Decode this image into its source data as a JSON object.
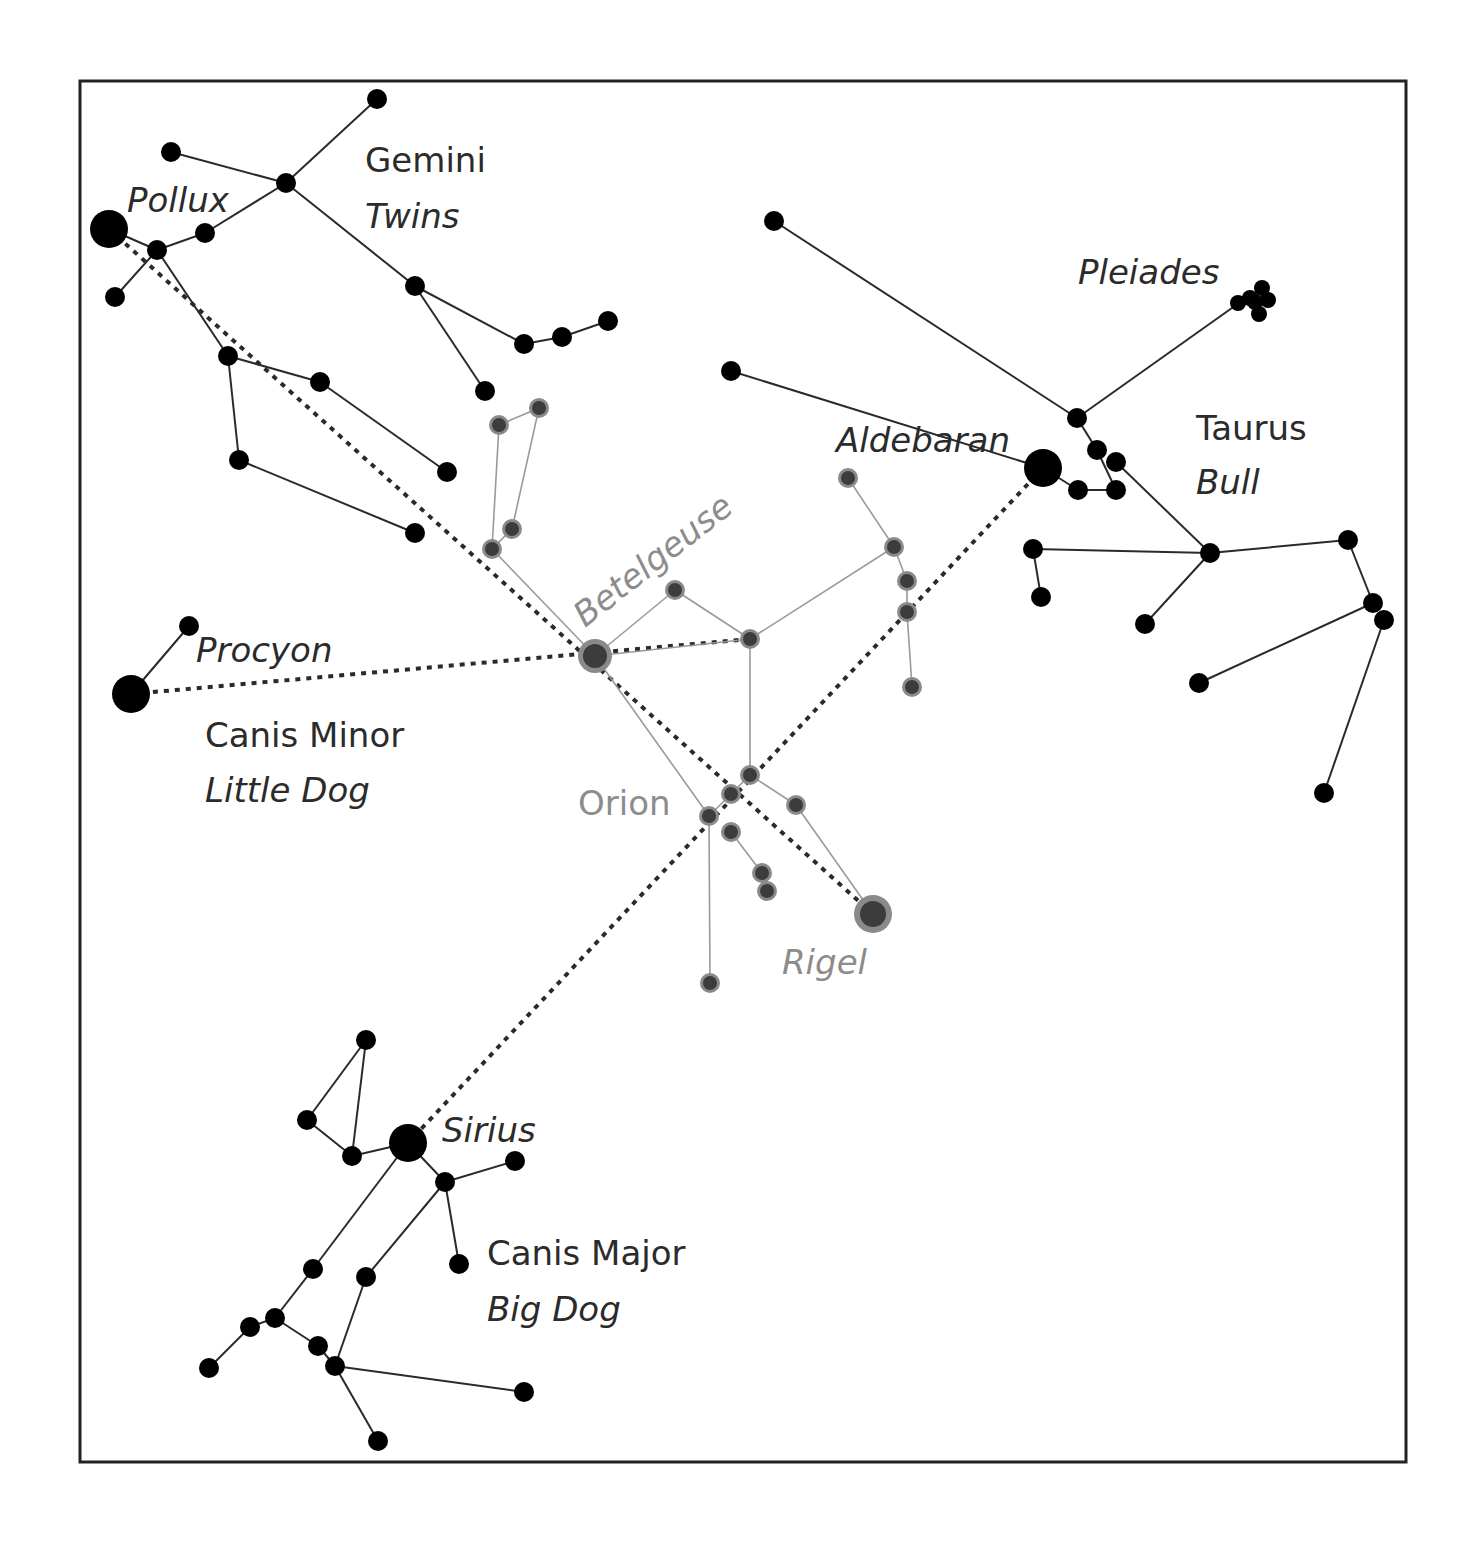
{
  "diagram": {
    "frame": {
      "x": 80,
      "y": 81,
      "width": 1326,
      "height": 1381
    },
    "colors": {
      "background": "#ffffff",
      "frame": "#222222",
      "star": "#000000",
      "line": "#2a2a2a",
      "orion_star_core": "#3c3c3c",
      "orion_star_halo": "#8a8a8a",
      "orion_line": "#9a9a9a",
      "label_dark": "#2b2b2b",
      "label_gray": "#8c8c8c"
    }
  },
  "labels": {
    "gemini": {
      "text": "Gemini",
      "x": 365,
      "y": 172,
      "italic": false,
      "gray": false
    },
    "twins": {
      "text": "Twins",
      "x": 365,
      "y": 228,
      "italic": true,
      "gray": false
    },
    "pollux": {
      "text": "Pollux",
      "x": 127,
      "y": 212,
      "italic": true,
      "gray": false
    },
    "pleiades": {
      "text": "Pleiades",
      "x": 1078,
      "y": 284,
      "italic": true,
      "gray": false
    },
    "aldebaran": {
      "text": "Aldebaran",
      "x": 836,
      "y": 452,
      "italic": true,
      "gray": false
    },
    "taurus": {
      "text": "Taurus",
      "x": 1196,
      "y": 440,
      "italic": false,
      "gray": false
    },
    "bull": {
      "text": "Bull",
      "x": 1196,
      "y": 494,
      "italic": true,
      "gray": false
    },
    "betelgeuse": {
      "text": "Betelgeuse",
      "x": 585,
      "y": 628,
      "italic": true,
      "gray": true,
      "rotate": -38
    },
    "procyon": {
      "text": "Procyon",
      "x": 196,
      "y": 662,
      "italic": true,
      "gray": false
    },
    "canis_minor": {
      "text": "Canis Minor",
      "x": 205,
      "y": 747,
      "italic": false,
      "gray": false
    },
    "little_dog": {
      "text": "Little Dog",
      "x": 205,
      "y": 802,
      "italic": true,
      "gray": false
    },
    "orion": {
      "text": "Orion",
      "x": 578,
      "y": 815,
      "italic": false,
      "gray": true
    },
    "rigel": {
      "text": "Rigel",
      "x": 782,
      "y": 974,
      "italic": true,
      "gray": true
    },
    "sirius": {
      "text": "Sirius",
      "x": 442,
      "y": 1142,
      "italic": true,
      "gray": false
    },
    "canis_major": {
      "text": "Canis Major",
      "x": 487,
      "y": 1265,
      "italic": false,
      "gray": false
    },
    "big_dog": {
      "text": "Big Dog",
      "x": 487,
      "y": 1321,
      "italic": true,
      "gray": false
    }
  },
  "constellations": [
    {
      "name": "Gemini",
      "style": "black",
      "stars": [
        {
          "id": "pollux",
          "x": 109,
          "y": 229,
          "r": 19
        },
        {
          "id": "g1",
          "x": 377,
          "y": 99,
          "r": 10
        },
        {
          "id": "g2",
          "x": 171,
          "y": 152,
          "r": 10
        },
        {
          "id": "g3",
          "x": 286,
          "y": 183,
          "r": 10
        },
        {
          "id": "g4",
          "x": 205,
          "y": 233,
          "r": 10
        },
        {
          "id": "g5",
          "x": 157,
          "y": 250,
          "r": 10
        },
        {
          "id": "g6",
          "x": 115,
          "y": 297,
          "r": 10
        },
        {
          "id": "g7",
          "x": 415,
          "y": 286,
          "r": 10
        },
        {
          "id": "g8",
          "x": 524,
          "y": 344,
          "r": 10
        },
        {
          "id": "g9",
          "x": 562,
          "y": 337,
          "r": 10
        },
        {
          "id": "g10",
          "x": 608,
          "y": 321,
          "r": 10
        },
        {
          "id": "g11",
          "x": 485,
          "y": 391,
          "r": 10
        },
        {
          "id": "g12",
          "x": 228,
          "y": 356,
          "r": 10
        },
        {
          "id": "g13",
          "x": 320,
          "y": 382,
          "r": 10
        },
        {
          "id": "g14",
          "x": 447,
          "y": 472,
          "r": 10
        },
        {
          "id": "g15",
          "x": 239,
          "y": 460,
          "r": 10
        },
        {
          "id": "g16",
          "x": 415,
          "y": 533,
          "r": 10
        }
      ],
      "lines": [
        [
          377,
          99,
          286,
          183
        ],
        [
          171,
          152,
          286,
          183
        ],
        [
          286,
          183,
          205,
          233
        ],
        [
          205,
          233,
          157,
          250
        ],
        [
          109,
          229,
          157,
          250
        ],
        [
          157,
          250,
          115,
          297
        ],
        [
          286,
          183,
          415,
          286
        ],
        [
          415,
          286,
          524,
          344
        ],
        [
          524,
          344,
          562,
          337
        ],
        [
          562,
          337,
          608,
          321
        ],
        [
          415,
          286,
          485,
          391
        ],
        [
          157,
          250,
          228,
          356
        ],
        [
          228,
          356,
          320,
          382
        ],
        [
          320,
          382,
          447,
          472
        ],
        [
          228,
          356,
          239,
          460
        ],
        [
          239,
          460,
          415,
          533
        ]
      ]
    },
    {
      "name": "Taurus",
      "style": "black",
      "stars": [
        {
          "id": "aldebaran",
          "x": 1043,
          "y": 468,
          "r": 19
        },
        {
          "id": "t1",
          "x": 774,
          "y": 221,
          "r": 10
        },
        {
          "id": "t2",
          "x": 731,
          "y": 371,
          "r": 10
        },
        {
          "id": "t3",
          "x": 1077,
          "y": 418,
          "r": 10
        },
        {
          "id": "t4",
          "x": 1097,
          "y": 450,
          "r": 10
        },
        {
          "id": "t5",
          "x": 1116,
          "y": 462,
          "r": 10
        },
        {
          "id": "t6",
          "x": 1078,
          "y": 490,
          "r": 10
        },
        {
          "id": "t7",
          "x": 1116,
          "y": 490,
          "r": 10
        },
        {
          "id": "t8",
          "x": 1210,
          "y": 553,
          "r": 10
        },
        {
          "id": "t9",
          "x": 1033,
          "y": 549,
          "r": 10
        },
        {
          "id": "t10",
          "x": 1041,
          "y": 597,
          "r": 10
        },
        {
          "id": "t11",
          "x": 1145,
          "y": 624,
          "r": 10
        },
        {
          "id": "t12",
          "x": 1348,
          "y": 540,
          "r": 10
        },
        {
          "id": "t13",
          "x": 1373,
          "y": 603,
          "r": 10
        },
        {
          "id": "t14",
          "x": 1384,
          "y": 620,
          "r": 10
        },
        {
          "id": "t15",
          "x": 1199,
          "y": 683,
          "r": 10
        },
        {
          "id": "t16",
          "x": 1324,
          "y": 793,
          "r": 10
        }
      ],
      "lines": [
        [
          774,
          221,
          1077,
          418
        ],
        [
          1077,
          418,
          1239,
          303
        ],
        [
          731,
          371,
          1043,
          468
        ],
        [
          1077,
          418,
          1097,
          450
        ],
        [
          1097,
          450,
          1116,
          490
        ],
        [
          1043,
          468,
          1078,
          490
        ],
        [
          1078,
          490,
          1116,
          490
        ],
        [
          1116,
          462,
          1210,
          553
        ],
        [
          1033,
          549,
          1210,
          553
        ],
        [
          1033,
          549,
          1041,
          597
        ],
        [
          1210,
          553,
          1145,
          624
        ],
        [
          1210,
          553,
          1348,
          540
        ],
        [
          1348,
          540,
          1373,
          603
        ],
        [
          1373,
          603,
          1199,
          683
        ],
        [
          1384,
          620,
          1324,
          793
        ]
      ]
    },
    {
      "name": "Pleiades",
      "style": "black",
      "stars": [
        {
          "id": "p1",
          "x": 1238,
          "y": 303,
          "r": 8
        },
        {
          "id": "p2",
          "x": 1250,
          "y": 298,
          "r": 8
        },
        {
          "id": "p3",
          "x": 1262,
          "y": 288,
          "r": 8
        },
        {
          "id": "p4",
          "x": 1268,
          "y": 300,
          "r": 8
        },
        {
          "id": "p5",
          "x": 1259,
          "y": 314,
          "r": 8
        },
        {
          "id": "p6",
          "x": 1255,
          "y": 302,
          "r": 8
        }
      ],
      "lines": []
    },
    {
      "name": "Orion",
      "style": "gray",
      "stars": [
        {
          "id": "betelgeuse",
          "x": 595,
          "y": 656,
          "r": 17
        },
        {
          "id": "rigel",
          "x": 873,
          "y": 914,
          "r": 19
        },
        {
          "id": "o1",
          "x": 499,
          "y": 425,
          "r": 10
        },
        {
          "id": "o2",
          "x": 539,
          "y": 408,
          "r": 10
        },
        {
          "id": "o3",
          "x": 512,
          "y": 529,
          "r": 10
        },
        {
          "id": "o4",
          "x": 492,
          "y": 549,
          "r": 10
        },
        {
          "id": "o5",
          "x": 675,
          "y": 590,
          "r": 10
        },
        {
          "id": "o6",
          "x": 750,
          "y": 639,
          "r": 10
        },
        {
          "id": "o7",
          "x": 848,
          "y": 478,
          "r": 10
        },
        {
          "id": "o8",
          "x": 894,
          "y": 547,
          "r": 10
        },
        {
          "id": "o9",
          "x": 907,
          "y": 581,
          "r": 10
        },
        {
          "id": "o10",
          "x": 907,
          "y": 612,
          "r": 10
        },
        {
          "id": "o11",
          "x": 912,
          "y": 687,
          "r": 10
        },
        {
          "id": "o12",
          "x": 750,
          "y": 775,
          "r": 10
        },
        {
          "id": "o13",
          "x": 731,
          "y": 794,
          "r": 10
        },
        {
          "id": "o14",
          "x": 709,
          "y": 816,
          "r": 10
        },
        {
          "id": "o15",
          "x": 796,
          "y": 805,
          "r": 10
        },
        {
          "id": "o16",
          "x": 731,
          "y": 832,
          "r": 10
        },
        {
          "id": "o17",
          "x": 762,
          "y": 873,
          "r": 10
        },
        {
          "id": "o18",
          "x": 767,
          "y": 891,
          "r": 10
        },
        {
          "id": "o19",
          "x": 710,
          "y": 983,
          "r": 10
        }
      ],
      "lines": [
        [
          499,
          425,
          539,
          408
        ],
        [
          499,
          425,
          492,
          549
        ],
        [
          539,
          408,
          512,
          529
        ],
        [
          512,
          529,
          492,
          549
        ],
        [
          492,
          549,
          595,
          656
        ],
        [
          595,
          656,
          675,
          590
        ],
        [
          675,
          590,
          750,
          639
        ],
        [
          595,
          656,
          750,
          639
        ],
        [
          750,
          639,
          894,
          547
        ],
        [
          848,
          478,
          894,
          547
        ],
        [
          894,
          547,
          907,
          581
        ],
        [
          907,
          581,
          907,
          612
        ],
        [
          907,
          612,
          912,
          687
        ],
        [
          750,
          639,
          750,
          775
        ],
        [
          595,
          656,
          709,
          816
        ],
        [
          709,
          816,
          731,
          794
        ],
        [
          731,
          794,
          750,
          775
        ],
        [
          750,
          775,
          796,
          805
        ],
        [
          796,
          805,
          873,
          914
        ],
        [
          709,
          816,
          710,
          983
        ],
        [
          731,
          832,
          762,
          873
        ]
      ]
    },
    {
      "name": "Canis Minor",
      "style": "black",
      "stars": [
        {
          "id": "procyon",
          "x": 131,
          "y": 694,
          "r": 19
        },
        {
          "id": "cm1",
          "x": 189,
          "y": 626,
          "r": 10
        }
      ],
      "lines": [
        [
          131,
          694,
          189,
          626
        ]
      ]
    },
    {
      "name": "Canis Major",
      "style": "black",
      "stars": [
        {
          "id": "sirius",
          "x": 408,
          "y": 1143,
          "r": 19
        },
        {
          "id": "cma1",
          "x": 366,
          "y": 1040,
          "r": 10
        },
        {
          "id": "cma2",
          "x": 307,
          "y": 1120,
          "r": 10
        },
        {
          "id": "cma3",
          "x": 352,
          "y": 1156,
          "r": 10
        },
        {
          "id": "cma4",
          "x": 515,
          "y": 1161,
          "r": 10
        },
        {
          "id": "cma5",
          "x": 445,
          "y": 1182,
          "r": 10
        },
        {
          "id": "cma6",
          "x": 459,
          "y": 1264,
          "r": 10
        },
        {
          "id": "cma7",
          "x": 313,
          "y": 1269,
          "r": 10
        },
        {
          "id": "cma8",
          "x": 366,
          "y": 1277,
          "r": 10
        },
        {
          "id": "cma9",
          "x": 275,
          "y": 1318,
          "r": 10
        },
        {
          "id": "cma10",
          "x": 250,
          "y": 1327,
          "r": 10
        },
        {
          "id": "cma11",
          "x": 318,
          "y": 1346,
          "r": 10
        },
        {
          "id": "cma12",
          "x": 335,
          "y": 1366,
          "r": 10
        },
        {
          "id": "cma13",
          "x": 209,
          "y": 1368,
          "r": 10
        },
        {
          "id": "cma14",
          "x": 524,
          "y": 1392,
          "r": 10
        },
        {
          "id": "cma15",
          "x": 378,
          "y": 1441,
          "r": 10
        }
      ],
      "lines": [
        [
          366,
          1040,
          307,
          1120
        ],
        [
          366,
          1040,
          352,
          1156
        ],
        [
          307,
          1120,
          352,
          1156
        ],
        [
          352,
          1156,
          408,
          1143
        ],
        [
          408,
          1143,
          445,
          1182
        ],
        [
          445,
          1182,
          515,
          1161
        ],
        [
          445,
          1182,
          459,
          1264
        ],
        [
          408,
          1143,
          313,
          1269
        ],
        [
          313,
          1269,
          275,
          1318
        ],
        [
          275,
          1318,
          250,
          1327
        ],
        [
          250,
          1327,
          209,
          1368
        ],
        [
          275,
          1318,
          318,
          1346
        ],
        [
          318,
          1346,
          335,
          1366
        ],
        [
          445,
          1182,
          366,
          1277
        ],
        [
          366,
          1277,
          335,
          1366
        ],
        [
          335,
          1366,
          524,
          1392
        ],
        [
          335,
          1366,
          378,
          1441
        ]
      ]
    }
  ],
  "pointer_lines": [
    {
      "name": "pollux-to-rigel",
      "x1": 109,
      "y1": 229,
      "x2": 873,
      "y2": 914
    },
    {
      "name": "procyon-to-betelgeuse-belt",
      "x1": 131,
      "y1": 694,
      "x2": 750,
      "y2": 639
    },
    {
      "name": "aldebaran-to-sirius",
      "x1": 1043,
      "y1": 468,
      "x2": 408,
      "y2": 1143
    }
  ]
}
